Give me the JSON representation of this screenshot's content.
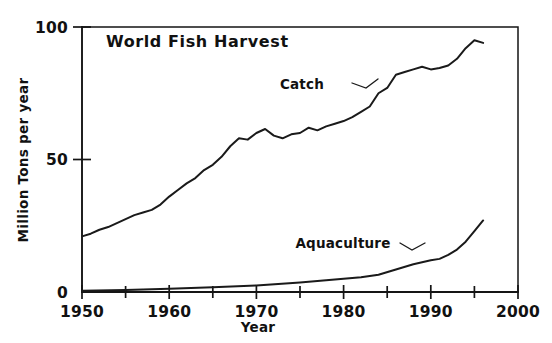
{
  "chart_data": {
    "type": "line",
    "title": "World Fish Harvest",
    "xlabel": "Year",
    "ylabel": "Million Tons per year",
    "xlim": [
      1950,
      2000
    ],
    "ylim": [
      0,
      100
    ],
    "grid": false,
    "legend_position": "inline-annotations",
    "x_ticks_major": [
      1950,
      1960,
      1970,
      1980,
      1990,
      2000
    ],
    "x_ticks_major_labels": [
      "1950",
      "1960",
      "1970",
      "1980",
      "1990",
      "2000"
    ],
    "x_ticks_minor": [
      1955,
      1965,
      1975,
      1985,
      1995
    ],
    "y_ticks_major": [
      0,
      50,
      100
    ],
    "y_ticks_major_labels": [
      "0",
      "50",
      "100"
    ],
    "annotations": [
      {
        "text": "Catch",
        "x": 1972.5,
        "y": 78.0
      },
      {
        "text": "Aquaculture",
        "x": 1971.0,
        "y": 21.5
      }
    ],
    "series": [
      {
        "name": "Catch",
        "x": [
          1950,
          1951,
          1952,
          1953,
          1954,
          1955,
          1956,
          1957,
          1958,
          1959,
          1960,
          1961,
          1962,
          1963,
          1964,
          1965,
          1966,
          1967,
          1968,
          1969,
          1970,
          1971,
          1972,
          1973,
          1974,
          1975,
          1976,
          1977,
          1978,
          1979,
          1980,
          1981,
          1982,
          1983,
          1984,
          1985,
          1986,
          1987,
          1988,
          1989,
          1990,
          1991,
          1992,
          1993,
          1994,
          1995,
          1996
        ],
        "values": [
          21,
          22,
          23.5,
          24.5,
          26,
          27.5,
          29,
          30,
          31,
          33,
          36,
          38.5,
          41,
          43,
          46,
          48,
          51,
          55,
          58,
          57.5,
          60,
          61.5,
          59,
          58,
          59.5,
          60,
          62,
          61,
          62.5,
          63.5,
          64.5,
          66,
          68,
          70,
          75,
          77,
          82,
          83,
          84,
          85,
          84,
          84.5,
          85.5,
          88,
          92,
          95,
          94
        ]
      },
      {
        "name": "Aquaculture",
        "x": [
          1950,
          1955,
          1960,
          1965,
          1970,
          1975,
          1980,
          1982,
          1984,
          1986,
          1988,
          1990,
          1991,
          1992,
          1993,
          1994,
          1995,
          1996
        ],
        "values": [
          0.5,
          0.8,
          1.2,
          1.8,
          2.5,
          3.6,
          5.0,
          5.6,
          6.5,
          8.5,
          10.5,
          12.0,
          12.5,
          14.0,
          16.0,
          19.0,
          23.0,
          27.0
        ]
      }
    ]
  }
}
